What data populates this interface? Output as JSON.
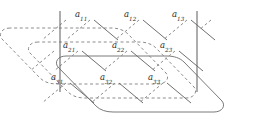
{
  "figure": {
    "colors": {
      "line": "#7f7f7f",
      "line_dark": "#6a6a6a",
      "label": "#2b2b2b",
      "background": "#ffffff"
    },
    "matrix": {
      "rows": 3,
      "cols": 3,
      "base": "a",
      "elements": [
        [
          {
            "name": "a11",
            "base": "a",
            "sub": "11",
            "x": 75,
            "y": 14
          },
          {
            "name": "a12",
            "base": "a",
            "sub": "12",
            "x": 124,
            "y": 14
          },
          {
            "name": "a13",
            "base": "a",
            "sub": "13",
            "x": 172,
            "y": 14
          }
        ],
        [
          {
            "name": "a21",
            "base": "a",
            "sub": "21",
            "x": 63,
            "y": 45
          },
          {
            "name": "a22",
            "base": "a",
            "sub": "22",
            "x": 112,
            "y": 45
          },
          {
            "name": "a23",
            "base": "a",
            "sub": "23",
            "x": 160,
            "y": 45
          }
        ],
        [
          {
            "name": "a31",
            "base": "a",
            "sub": "31",
            "x": 51,
            "y": 77
          },
          {
            "name": "a32",
            "base": "a",
            "sub": "32",
            "x": 100,
            "y": 77
          },
          {
            "name": "a33",
            "base": "a",
            "sub": "33",
            "x": 148,
            "y": 77
          }
        ]
      ]
    },
    "layers": [
      {
        "name": "layer-back-dashed",
        "style": "dashed",
        "offset_x": 0,
        "offset_y": 0
      },
      {
        "name": "layer-middle-dashed",
        "style": "dashed",
        "offset_x": 28,
        "offset_y": 14
      },
      {
        "name": "layer-front-solid",
        "style": "solid",
        "offset_x": 56,
        "offset_y": 28
      }
    ],
    "vertical_lines": [
      {
        "name": "vertical-line-left",
        "x": 60,
        "y1": 11,
        "y2": 92
      },
      {
        "name": "vertical-line-right",
        "x": 197,
        "y1": 11,
        "y2": 92
      }
    ]
  }
}
